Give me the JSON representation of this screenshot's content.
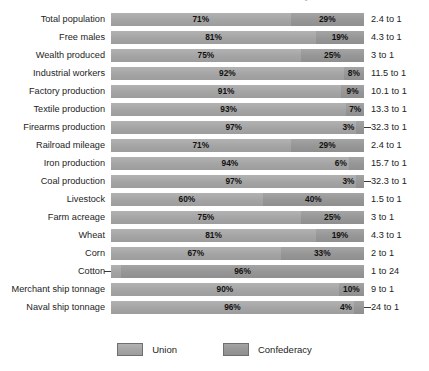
{
  "chart_data": {
    "type": "bar",
    "subtype": "stacked-horizontal-100pct",
    "title": "Resources of the Union and the Confederacy",
    "xlabel": "",
    "ylabel": "",
    "xlim": [
      0,
      100
    ],
    "grid": false,
    "legend_position": "bottom-center",
    "categories": [
      "Total population",
      "Free males",
      "Wealth produced",
      "Industrial workers",
      "Factory production",
      "Textile production",
      "Firearms production",
      "Railroad mileage",
      "Iron production",
      "Coal production",
      "Livestock",
      "Farm acreage",
      "Wheat",
      "Corn",
      "Cotton",
      "Merchant ship tonnage",
      "Naval ship tonnage"
    ],
    "series": [
      {
        "name": "Union",
        "color": "#a8a8a8",
        "values": [
          71,
          81,
          75,
          92,
          91,
          93,
          97,
          71,
          94,
          97,
          60,
          75,
          81,
          67,
          4,
          90,
          96
        ]
      },
      {
        "name": "Confederacy",
        "color": "#9a9a9a",
        "values": [
          29,
          19,
          25,
          8,
          9,
          7,
          3,
          29,
          6,
          3,
          40,
          25,
          19,
          33,
          96,
          10,
          4
        ]
      }
    ],
    "value_labels": {
      "union": [
        "71%",
        "81%",
        "75%",
        "92%",
        "91%",
        "93%",
        "97%",
        "71%",
        "94%",
        "97%",
        "60%",
        "75%",
        "81%",
        "67%",
        "4%",
        "90%",
        "96%"
      ],
      "confederacy": [
        "29%",
        "19%",
        "25%",
        "8%",
        "9%",
        "7%",
        "3%",
        "29%",
        "6%",
        "3%",
        "40%",
        "25%",
        "19%",
        "33%",
        "96%",
        "10%",
        "4%"
      ]
    },
    "ratios": [
      "2.4 to 1",
      "4.3 to 1",
      "3 to 1",
      "11.5 to 1",
      "10.1 to 1",
      "13.3 to 1",
      "32.3 to 1",
      "2.4 to 1",
      "15.7 to 1",
      "32.3 to 1",
      "1.5 to 1",
      "3 to 1",
      "4.3 to 1",
      "2 to 1",
      "1 to 24",
      "9 to 1",
      "24 to 1"
    ]
  },
  "rows": [
    {
      "label": "Total population",
      "union": 71,
      "confederacy": 29,
      "union_label": "71%",
      "conf_label": "29%",
      "ratio": "2.4 to 1",
      "union_outside": false,
      "conf_outside": false,
      "conf_leader": false,
      "union_leader": false
    },
    {
      "label": "Free males",
      "union": 81,
      "confederacy": 19,
      "union_label": "81%",
      "conf_label": "19%",
      "ratio": "4.3 to 1",
      "union_outside": false,
      "conf_outside": false,
      "conf_leader": false,
      "union_leader": false
    },
    {
      "label": "Wealth produced",
      "union": 75,
      "confederacy": 25,
      "union_label": "75%",
      "conf_label": "25%",
      "ratio": "3 to 1",
      "union_outside": false,
      "conf_outside": false,
      "conf_leader": false,
      "union_leader": false
    },
    {
      "label": "Industrial workers",
      "union": 92,
      "confederacy": 8,
      "union_label": "92%",
      "conf_label": "8%",
      "ratio": "11.5 to 1",
      "union_outside": false,
      "conf_outside": false,
      "conf_leader": false,
      "union_leader": false
    },
    {
      "label": "Factory production",
      "union": 91,
      "confederacy": 9,
      "union_label": "91%",
      "conf_label": "9%",
      "ratio": "10.1 to 1",
      "union_outside": false,
      "conf_outside": false,
      "conf_leader": false,
      "union_leader": false
    },
    {
      "label": "Textile production",
      "union": 93,
      "confederacy": 7,
      "union_label": "93%",
      "conf_label": "7%",
      "ratio": "13.3 to 1",
      "union_outside": false,
      "conf_outside": false,
      "conf_leader": false,
      "union_leader": false
    },
    {
      "label": "Firearms production",
      "union": 97,
      "confederacy": 3,
      "union_label": "97%",
      "conf_label": "3%",
      "ratio": "32.3 to 1",
      "union_outside": false,
      "conf_outside": true,
      "conf_leader": true,
      "union_leader": false
    },
    {
      "label": "Railroad mileage",
      "union": 71,
      "confederacy": 29,
      "union_label": "71%",
      "conf_label": "29%",
      "ratio": "2.4 to 1",
      "union_outside": false,
      "conf_outside": false,
      "conf_leader": false,
      "union_leader": false
    },
    {
      "label": "Iron production",
      "union": 94,
      "confederacy": 6,
      "union_label": "94%",
      "conf_label": "6%",
      "ratio": "15.7 to 1",
      "union_outside": false,
      "conf_outside": true,
      "conf_leader": false,
      "union_leader": false
    },
    {
      "label": "Coal production",
      "union": 97,
      "confederacy": 3,
      "union_label": "97%",
      "conf_label": "3%",
      "ratio": "32.3 to 1",
      "union_outside": false,
      "conf_outside": true,
      "conf_leader": true,
      "union_leader": false
    },
    {
      "label": "Livestock",
      "union": 60,
      "confederacy": 40,
      "union_label": "60%",
      "conf_label": "40%",
      "ratio": "1.5 to 1",
      "union_outside": false,
      "conf_outside": false,
      "conf_leader": false,
      "union_leader": false
    },
    {
      "label": "Farm acreage",
      "union": 75,
      "confederacy": 25,
      "union_label": "75%",
      "conf_label": "25%",
      "ratio": "3 to 1",
      "union_outside": false,
      "conf_outside": false,
      "conf_leader": false,
      "union_leader": false
    },
    {
      "label": "Wheat",
      "union": 81,
      "confederacy": 19,
      "union_label": "81%",
      "conf_label": "19%",
      "ratio": "4.3 to 1",
      "union_outside": false,
      "conf_outside": false,
      "conf_leader": false,
      "union_leader": false
    },
    {
      "label": "Corn",
      "union": 67,
      "confederacy": 33,
      "union_label": "67%",
      "conf_label": "33%",
      "ratio": "2 to 1",
      "union_outside": false,
      "conf_outside": false,
      "conf_leader": false,
      "union_leader": false
    },
    {
      "label": "Cotton",
      "union": 4,
      "confederacy": 96,
      "union_label": "4%",
      "conf_label": "96%",
      "ratio": "1 to 24",
      "union_outside": true,
      "conf_outside": false,
      "conf_leader": false,
      "union_leader": true
    },
    {
      "label": "Merchant ship tonnage",
      "union": 90,
      "confederacy": 10,
      "union_label": "90%",
      "conf_label": "10%",
      "ratio": "9 to 1",
      "union_outside": false,
      "conf_outside": false,
      "conf_leader": false,
      "union_leader": false
    },
    {
      "label": "Naval ship tonnage",
      "union": 96,
      "confederacy": 4,
      "union_label": "96%",
      "conf_label": "4%",
      "ratio": "24 to 1",
      "union_outside": false,
      "conf_outside": true,
      "conf_leader": true,
      "union_leader": false
    }
  ],
  "legend": {
    "items": [
      {
        "label": "Union",
        "swatch": "union"
      },
      {
        "label": "Confederacy",
        "swatch": "conf"
      }
    ]
  }
}
